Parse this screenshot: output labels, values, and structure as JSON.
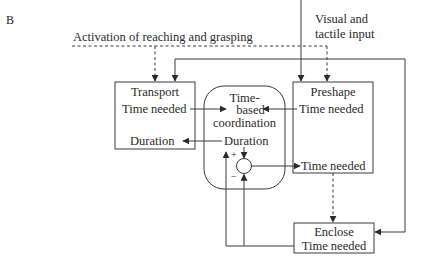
{
  "panel_label": "B",
  "inputs": {
    "activation": "Activation of reaching and grasping",
    "sensory_line1": "Visual and",
    "sensory_line2": "tactile input"
  },
  "transport": {
    "title": "Transport",
    "time_needed": "Time needed",
    "duration": "Duration"
  },
  "coordination": {
    "line1": "Time-",
    "line2": "based",
    "line3": "coordination",
    "duration": "Duration",
    "plus": "+",
    "minus": "−"
  },
  "preshape": {
    "title": "Preshape",
    "time_needed_top": "Time needed",
    "time_needed_bottom": "Time needed"
  },
  "enclose": {
    "title": "Enclose",
    "time_needed": "Time needed"
  },
  "colors": {
    "line": "#3a3a3a",
    "text": "#2a2a2a",
    "background": "#ffffff"
  }
}
